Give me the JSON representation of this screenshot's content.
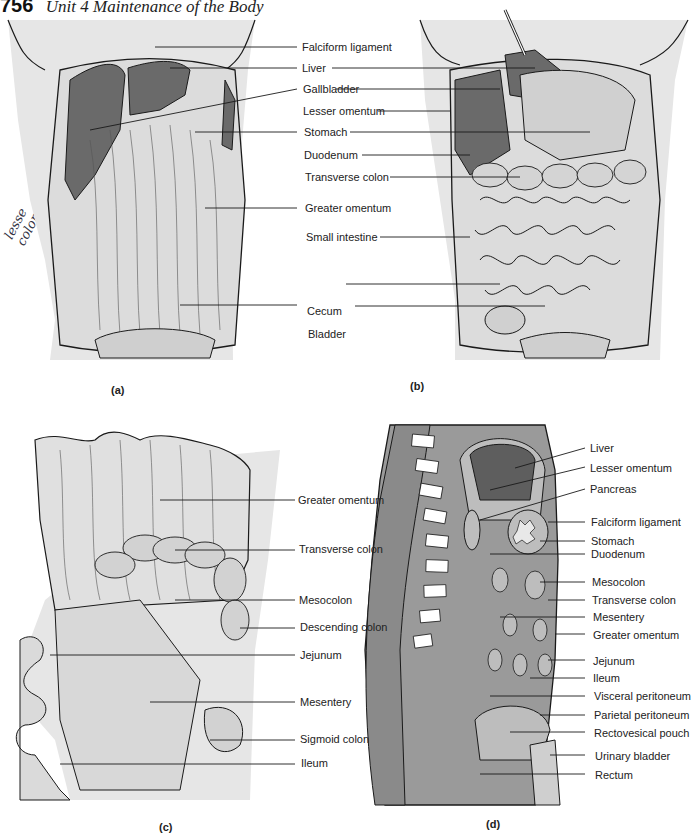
{
  "header": {
    "page_number": "756",
    "running_title": "Unit 4   Maintenance of the Body"
  },
  "margin_note": {
    "lines": [
      "lesse",
      "colon"
    ]
  },
  "colors": {
    "background_skin": "#e6e6e6",
    "organ_dark": "#6a6a6a",
    "organ_medium": "#8c8c8c",
    "cavity_gray": "#9a9a9a",
    "outline": "#1a1a1a",
    "label_text": "#222222"
  },
  "panels": {
    "a": {
      "caption": "(a)",
      "labels": [
        "Falciform ligament",
        "Liver",
        "Gallbladder",
        "Lesser omentum",
        "Stomach",
        "Duodenum",
        "Transverse colon",
        "Greater omentum",
        "Small intestine",
        "Cecum",
        "Bladder"
      ]
    },
    "b": {
      "caption": "(b)"
    },
    "c": {
      "caption": "(c)",
      "labels": [
        "Greater omentum",
        "Transverse colon",
        "Mesocolon",
        "Descending colon",
        "Jejunum",
        "Mesentery",
        "Sigmoid colon",
        "Ileum"
      ]
    },
    "d": {
      "caption": "(d)",
      "labels": [
        "Liver",
        "Lesser omentum",
        "Pancreas",
        "Falciform ligament",
        "Stomach",
        "Duodenum",
        "Mesocolon",
        "Transverse colon",
        "Mesentery",
        "Greater omentum",
        "Jejunum",
        "Ileum",
        "Visceral peritoneum",
        "Parietal peritoneum",
        "Rectovesical pouch",
        "Urinary bladder",
        "Rectum"
      ]
    }
  }
}
